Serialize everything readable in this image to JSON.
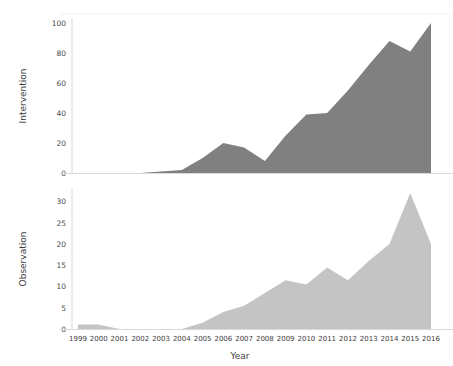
{
  "figure": {
    "x_axis_title": "Year",
    "background": "#ffffff"
  },
  "chart_data": [
    {
      "type": "area",
      "title": "",
      "xlabel": "Year",
      "ylabel": "Intervention",
      "categories": [
        "1999",
        "2000",
        "2001",
        "2002",
        "2003",
        "2004",
        "2005",
        "2006",
        "2007",
        "2008",
        "2009",
        "2010",
        "2011",
        "2012",
        "2013",
        "2014",
        "2015",
        "2016"
      ],
      "values": [
        0,
        0,
        0,
        0,
        1,
        2,
        10,
        20,
        17,
        8,
        25,
        39,
        40,
        55,
        72,
        88,
        81,
        100
      ],
      "ylim": [
        0,
        100
      ],
      "yticks": [
        0,
        20,
        40,
        60,
        80,
        100
      ],
      "grid": false,
      "legend": "none",
      "color": "#808080"
    },
    {
      "type": "area",
      "title": "",
      "xlabel": "Year",
      "ylabel": "Observation",
      "categories": [
        "1999",
        "2000",
        "2001",
        "2002",
        "2003",
        "2004",
        "2005",
        "2006",
        "2007",
        "2008",
        "2009",
        "2010",
        "2011",
        "2012",
        "2013",
        "2014",
        "2015",
        "2016"
      ],
      "values": [
        1,
        1,
        0,
        0,
        0,
        0,
        1.5,
        4,
        5.5,
        8.5,
        11.5,
        10.5,
        14.5,
        11.5,
        16,
        20,
        32,
        20
      ],
      "ylim": [
        0,
        32
      ],
      "yticks": [
        0,
        5,
        10,
        15,
        20,
        25,
        30
      ],
      "grid": false,
      "legend": "none",
      "color": "#c4c4c4"
    }
  ],
  "panel_intervention": {
    "ylabel": "Intervention",
    "ytick_labels": [
      "100",
      "80",
      "60",
      "40",
      "20",
      "0"
    ]
  },
  "panel_observation": {
    "ylabel": "Observation",
    "ytick_labels": [
      "30",
      "25",
      "20",
      "15",
      "10",
      "5",
      "0"
    ]
  },
  "xtick_labels": [
    "1999",
    "2000",
    "2001",
    "2002",
    "2003",
    "2004",
    "2005",
    "2006",
    "2007",
    "2008",
    "2009",
    "2010",
    "2011",
    "2012",
    "2013",
    "2014",
    "2015",
    "2016"
  ]
}
